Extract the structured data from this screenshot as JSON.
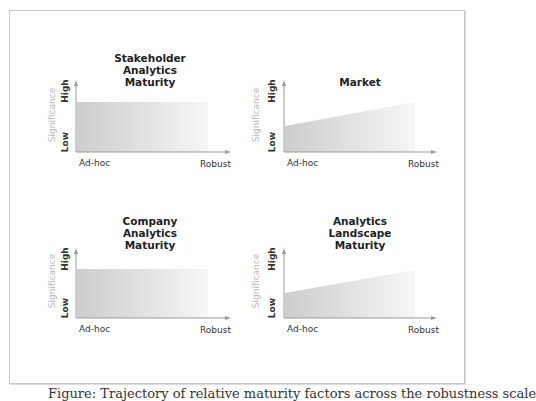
{
  "panels": [
    {
      "id": "stakeholder",
      "title": "Stakeholder\nAnalytics\nMaturity",
      "shape": "flat",
      "y_label": "Significance",
      "y_high": "High",
      "y_low": "Low",
      "x_low": "Ad-hoc",
      "x_high": "Robust"
    },
    {
      "id": "market",
      "title": "Market",
      "shape": "rising",
      "y_label": "Significance",
      "y_high": "High",
      "y_low": "Low",
      "x_low": "Ad-hoc",
      "x_high": "Robust"
    },
    {
      "id": "company",
      "title": "Company\nAnalytics\nMaturity",
      "shape": "flat",
      "y_label": "Significance",
      "y_high": "High",
      "y_low": "Low",
      "x_low": "Ad-hoc",
      "x_high": "Robust"
    },
    {
      "id": "landscape",
      "title": "Analytics\nLandscape\nMaturity",
      "shape": "rising",
      "y_label": "Significance",
      "y_high": "High",
      "y_low": "Low",
      "x_low": "Ad-hoc",
      "x_high": "Robust"
    }
  ],
  "caption": "Figure: Trajectory of relative maturity factors across the robustness scale",
  "colors": {
    "fill_dark": "#cfcfcf",
    "fill_light": "#f7f7f7",
    "axis": "#9a9a9a",
    "significance": "#b8b8b8"
  }
}
